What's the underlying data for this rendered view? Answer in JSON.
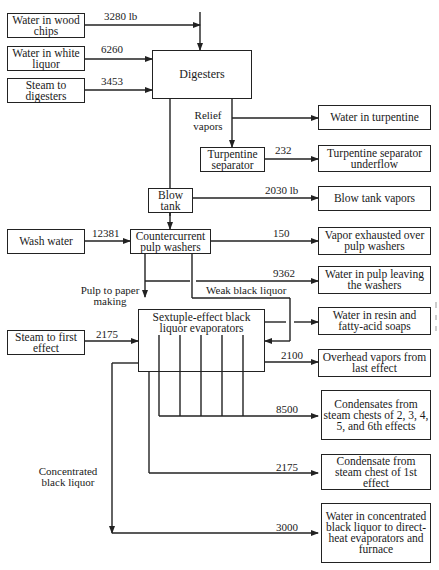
{
  "diagram": {
    "type": "process-flow",
    "units_note": "lb"
  },
  "nodes": {
    "water_wood_chips": "Water in wood chips",
    "water_white_liquor": "Water in white liquor",
    "steam_digesters": "Steam to digesters",
    "digesters": "Digesters",
    "turpentine_separator": "Turpentine separator",
    "water_turpentine": "Water in turpentine",
    "turpentine_underflow": "Turpentine separator underflow",
    "blow_tank": "Blow tank",
    "blow_tank_vapors": "Blow tank vapors",
    "wash_water": "Wash water",
    "pulp_washers": "Countercurrent pulp washers",
    "vapor_exhausted": "Vapor exhausted over pulp washers",
    "water_pulp_leaving": "Water in pulp leaving the washers",
    "water_resin": "Water in resin and fatty-acid soaps",
    "evaporators": "Sextuple-effect black liquor evaporators",
    "steam_first_effect": "Steam to first effect",
    "overhead_vapors": "Overhead vapors from last effect",
    "condensates_2_6": "Condensates from steam chests of 2, 3, 4, 5, and 6th effects",
    "condensate_1": "Condensate from steam chest of 1st effect",
    "water_conc_liquor": "Water in concentrated black liquor to direct-heat evaporators and furnace"
  },
  "labels": {
    "relief_vapors": "Relief vapors",
    "pulp_to_paper": "Pulp to paper making",
    "weak_black_liquor": "Weak black liquor",
    "concentrated_black_liquor": "Concentrated black liquor"
  },
  "flows": {
    "wood_chips": "3280 lb",
    "white_liquor": "6260",
    "steam_digesters": "3453",
    "turpentine_underflow": "232",
    "blow_tank_vapors": "2030 lb",
    "wash_water": "12381",
    "vapor_exhausted": "150",
    "pulp_leaving": "9362",
    "steam_first_effect": "2175",
    "overhead_vapors": "2100",
    "condensates_2_6": "8500",
    "condensate_1": "2175",
    "conc_liquor": "3000"
  }
}
